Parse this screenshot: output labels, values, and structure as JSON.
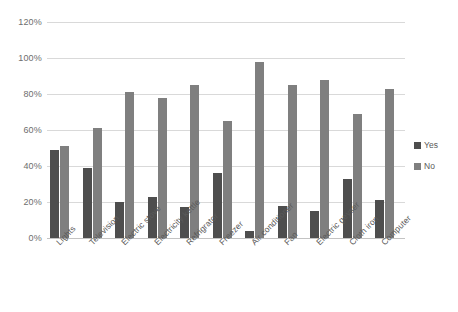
{
  "chart_data": {
    "type": "bar",
    "title": "",
    "subtitle": "",
    "xlabel": "",
    "ylabel": "",
    "ylim": [
      0,
      120
    ],
    "ytick_labels": [
      "0%",
      "20%",
      "40%",
      "60%",
      "80%",
      "100%",
      "120%"
    ],
    "ytick_values": [
      0,
      20,
      40,
      60,
      80,
      100,
      120
    ],
    "grid": true,
    "legend_position": "right",
    "categories": [
      "Lights",
      "Television",
      "Electric stove",
      "Electricity kettle",
      "Refrigrator",
      "Freezer",
      "Air conditioner",
      "Fan",
      "Electric geyser",
      "Cloth iron",
      "Computer"
    ],
    "series": [
      {
        "name": "Yes",
        "color": "#4e4e4e",
        "values": [
          49,
          39,
          20,
          23,
          17,
          36,
          4,
          18,
          15,
          33,
          21
        ]
      },
      {
        "name": "No",
        "color": "#7f7f7f",
        "values": [
          51,
          61,
          81,
          78,
          85,
          65,
          98,
          85,
          88,
          69,
          83
        ]
      }
    ]
  },
  "legend": {
    "items": [
      {
        "label": "Yes",
        "swatch": "yes"
      },
      {
        "label": "No",
        "swatch": "no"
      }
    ]
  },
  "colors": {
    "series_yes": "#4e4e4e",
    "series_no": "#7f7f7f",
    "gridline": "#d9d9d9",
    "axis_text": "#6e6e6e",
    "background": "#ffffff"
  }
}
